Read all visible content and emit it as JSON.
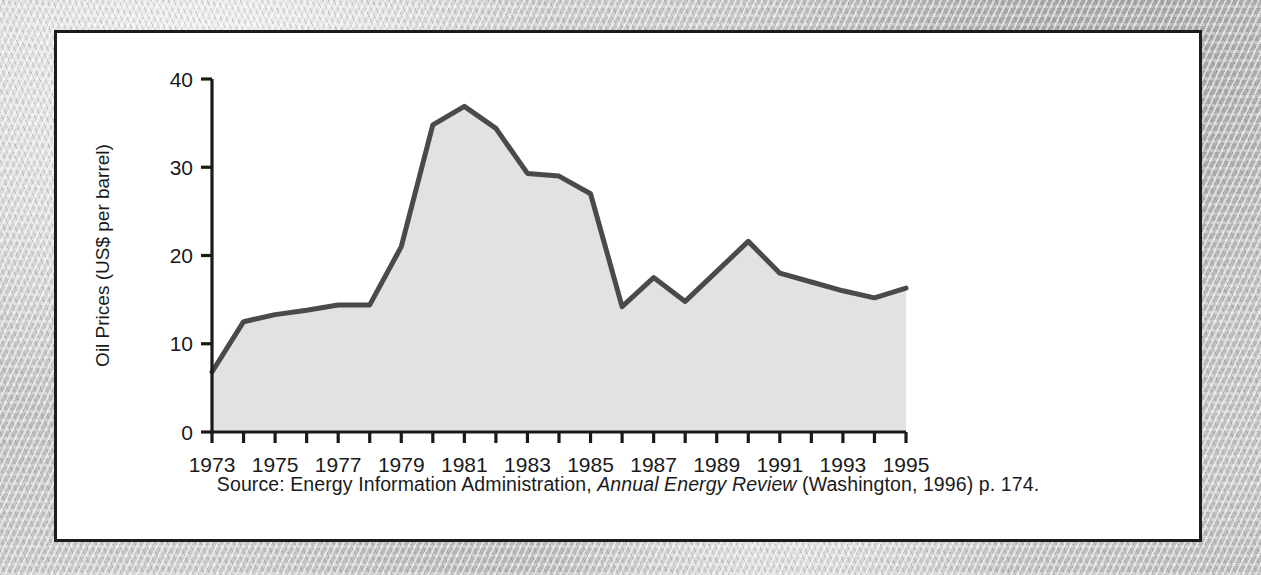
{
  "figure": {
    "caption_pre": "Source: Energy Information Administration, ",
    "caption_italic": "Annual Energy Review",
    "caption_post": " (Washington, 1996) p. 174."
  },
  "colors": {
    "line": "#4a4a4a",
    "fill": "#e2e2e2",
    "axis": "#1a1a1a",
    "panel_bg": "#ffffff",
    "panel_border": "#1c1c1c",
    "page_bg": "#c9c9c9"
  },
  "chart_data": {
    "type": "area",
    "title": "",
    "xlabel": "",
    "ylabel": "Oil Prices (US$ per barrel)",
    "ylim": [
      0,
      40
    ],
    "xlim": [
      1973,
      1995
    ],
    "yticks": [
      0,
      10,
      20,
      30,
      40
    ],
    "ytick_labels": [
      "0",
      "10",
      "20",
      "30",
      "40"
    ],
    "xticks": [
      1973,
      1974,
      1975,
      1976,
      1977,
      1978,
      1979,
      1980,
      1981,
      1982,
      1983,
      1984,
      1985,
      1986,
      1987,
      1988,
      1989,
      1990,
      1991,
      1992,
      1993,
      1994,
      1995
    ],
    "xtick_labels": [
      "1973",
      "",
      "1975",
      "",
      "1977",
      "",
      "1979",
      "",
      "1981",
      "",
      "1983",
      "",
      "1985",
      "",
      "1987",
      "",
      "1989",
      "",
      "1991",
      "",
      "1993",
      "",
      "1995"
    ],
    "xtick_labels_shown": [
      "1973",
      "1975",
      "1977",
      "1979",
      "1981",
      "1983",
      "1985",
      "1987",
      "1989",
      "1991",
      "1993",
      "1995"
    ],
    "grid": false,
    "legend": false,
    "x": [
      1973,
      1974,
      1975,
      1976,
      1977,
      1978,
      1979,
      1980,
      1981,
      1982,
      1983,
      1984,
      1985,
      1986,
      1987,
      1988,
      1989,
      1990,
      1991,
      1992,
      1993,
      1994,
      1995
    ],
    "values": [
      6.8,
      12.5,
      13.3,
      13.8,
      14.4,
      14.4,
      21.0,
      34.8,
      36.9,
      34.4,
      29.3,
      29.0,
      27.0,
      14.2,
      17.5,
      14.8,
      18.2,
      21.6,
      18.0,
      17.0,
      16.0,
      15.2,
      16.3
    ],
    "series": [
      {
        "name": "Oil Prices (US$ per barrel)",
        "values": [
          6.8,
          12.5,
          13.3,
          13.8,
          14.4,
          14.4,
          21.0,
          34.8,
          36.9,
          34.4,
          29.3,
          29.0,
          27.0,
          14.2,
          17.5,
          14.8,
          18.2,
          21.6,
          18.0,
          17.0,
          16.0,
          15.2,
          16.3
        ]
      }
    ]
  }
}
